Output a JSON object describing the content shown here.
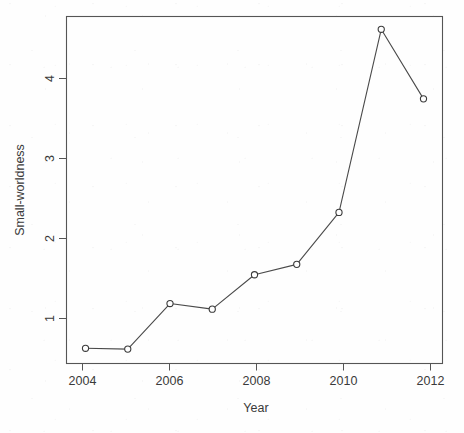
{
  "chart_data": {
    "type": "line",
    "title": "",
    "subtitle": "",
    "xlabel": "Year",
    "ylabel": "Small-worldness",
    "x": [
      2004,
      2005,
      2006,
      2007,
      2008,
      2009,
      2010,
      2011,
      2012
    ],
    "values": [
      0.63,
      0.62,
      1.19,
      1.12,
      1.55,
      1.68,
      2.33,
      4.62,
      3.75
    ],
    "series": [
      {
        "name": "Small-worldness",
        "values": [
          0.63,
          0.62,
          1.19,
          1.12,
          1.55,
          1.68,
          2.33,
          4.62,
          3.75
        ]
      }
    ],
    "xlim": [
      2003.55,
      2012.45
    ],
    "ylim": [
      0.44,
      4.78
    ],
    "xticks": [
      2004,
      2006,
      2008,
      2010,
      2012
    ],
    "xtick_labels": [
      "2004",
      "2006",
      "2008",
      "2010",
      "2012"
    ],
    "yticks": [
      1,
      2,
      3,
      4
    ],
    "ytick_labels": [
      "1",
      "2",
      "3",
      "4"
    ],
    "grid": false,
    "legend": false,
    "legend_position": "none",
    "marker": "open-circle",
    "line_color": "#4a4a4a",
    "marker_fill": "#ffffff",
    "marker_stroke": "#3b3b3b",
    "axis_color": "#555555",
    "background": "#ffffff"
  },
  "axes": {
    "x_title": "Year",
    "y_title": "Small-worldness"
  }
}
